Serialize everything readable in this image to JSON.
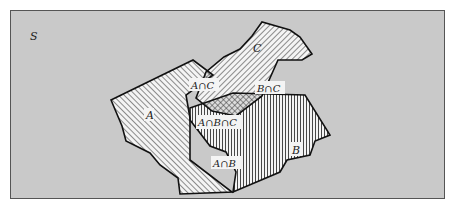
{
  "diagram": {
    "type": "venn-diagram",
    "universe_label": "S",
    "background_color": "#c9c9c9",
    "frame_color": "#555555",
    "sets": [
      {
        "id": "A",
        "label": "A",
        "hatch": "diagonal-backslash"
      },
      {
        "id": "B",
        "label": "B",
        "hatch": "vertical"
      },
      {
        "id": "C",
        "label": "C",
        "hatch": "diagonal-slash"
      }
    ],
    "intersections": [
      {
        "id": "AnC",
        "label": "A∩C",
        "hatch": "crosshatch"
      },
      {
        "id": "BnC",
        "label": "B∩C",
        "hatch": "crosshatch"
      },
      {
        "id": "AnB",
        "label": "A∩B",
        "hatch": "crosshatch"
      },
      {
        "id": "AnBnC",
        "label": "A∩B∩C",
        "hatch": "dense-crosshatch"
      }
    ]
  }
}
